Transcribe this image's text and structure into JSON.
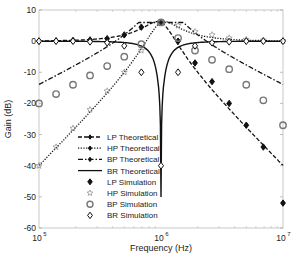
{
  "chart_data": {
    "type": "line",
    "title": "",
    "xlabel": "Frequency (Hz)",
    "ylabel": "Gain (dB)",
    "xscale": "log",
    "xlim": [
      100000,
      10000000
    ],
    "ylim": [
      -60,
      10
    ],
    "x_ticks": [
      "10^5",
      "10^6",
      "10^7"
    ],
    "y_ticks": [
      10,
      0,
      -10,
      -20,
      -30,
      -40,
      -50,
      -60
    ],
    "grid": false,
    "legend_position": "lower-left inside",
    "legend": [
      {
        "label": "LP Theoretical",
        "style": "dashed-diamond"
      },
      {
        "label": "HP Theoretical",
        "style": "dotted-diamond"
      },
      {
        "label": "BP Theoretical",
        "style": "dashdot-diamond"
      },
      {
        "label": "BR Theoretical",
        "style": "solid"
      },
      {
        "label": "LP Simulation",
        "style": "filled-diamond"
      },
      {
        "label": "HP Simulation",
        "style": "star"
      },
      {
        "label": "BP Simulation",
        "style": "circle"
      },
      {
        "label": "BR Simulation",
        "style": "open-diamond"
      }
    ],
    "x": [
      100000,
      138000,
      190000,
      262000,
      362000,
      500000,
      690000,
      1000000,
      1380000,
      1900000,
      2620000,
      3620000,
      5000000,
      6900000,
      10000000
    ],
    "series": [
      {
        "name": "LP Theoretical",
        "values": [
          0,
          0.1,
          0.2,
          0.4,
          0.8,
          2,
          4.5,
          6,
          0,
          -7,
          -13,
          -19,
          -26,
          -31,
          -38
        ]
      },
      {
        "name": "HP Theoretical",
        "values": [
          -40,
          -34,
          -28,
          -22,
          -16,
          -10,
          -3,
          6,
          5,
          3,
          2,
          1,
          0.5,
          0.3,
          0.1
        ]
      },
      {
        "name": "BP Theoretical",
        "values": [
          -20,
          -17,
          -14,
          -11,
          -8,
          -5,
          -1,
          6,
          1,
          -3,
          -6,
          -9,
          -12,
          -15,
          -18
        ]
      },
      {
        "name": "BR Theoretical",
        "values": [
          0,
          0,
          0,
          -0.2,
          -0.5,
          -1.5,
          -5,
          -50,
          -5,
          -1.5,
          -0.5,
          -0.2,
          0,
          0,
          0
        ]
      },
      {
        "name": "LP Simulation",
        "values": [
          0,
          0.1,
          0.2,
          0.4,
          0.8,
          2,
          4.5,
          6,
          0,
          -7,
          -13,
          -20,
          -27,
          -34,
          -52
        ]
      },
      {
        "name": "HP Simulation",
        "values": [
          -40,
          -34,
          -28,
          -22,
          -16,
          -10,
          -3,
          6,
          5,
          3,
          2,
          1,
          0.5,
          0.3,
          0.1
        ]
      },
      {
        "name": "BP Simulation",
        "values": [
          -20,
          -17,
          -14,
          -11,
          -8,
          -5,
          -1,
          6,
          1,
          -3,
          -6,
          -9,
          -14,
          -19,
          -27
        ]
      },
      {
        "name": "BR Simulation",
        "values": [
          0,
          0,
          0,
          -0.2,
          -0.5,
          -1.5,
          -10,
          -40,
          -10,
          -1.5,
          -0.5,
          -0.2,
          0,
          0,
          0
        ]
      }
    ]
  }
}
